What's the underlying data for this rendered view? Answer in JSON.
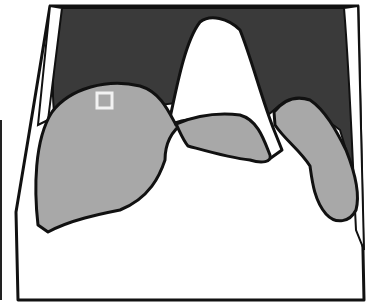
{
  "diagram": {
    "kind": "schematic cross-section",
    "colors": {
      "background": "#ffffff",
      "outline": "#111111",
      "dark_region": "#3a3a3a",
      "organ_fill": "#a8a8a8",
      "roi_marker": "#f2f2f2"
    },
    "regions": [
      {
        "id": "body-outline",
        "fill": "white"
      },
      {
        "id": "dark-background",
        "fill": "dark gray"
      },
      {
        "id": "central-white-structure",
        "fill": "white"
      },
      {
        "id": "left-organ",
        "fill": "gray"
      },
      {
        "id": "middle-lobe",
        "fill": "gray"
      },
      {
        "id": "right-organ",
        "fill": "gray"
      },
      {
        "id": "roi-square",
        "fill": "none",
        "stroke": "light"
      }
    ],
    "roi": {
      "x": 96,
      "y": 92,
      "width": 16,
      "height": 16
    }
  }
}
